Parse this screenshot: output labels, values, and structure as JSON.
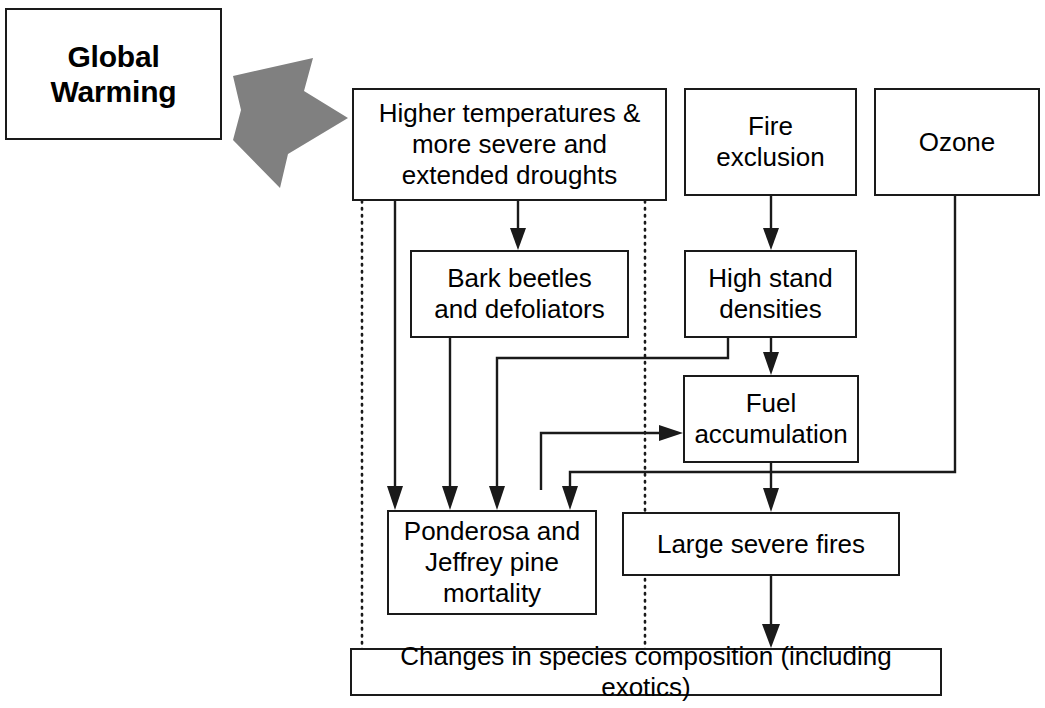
{
  "diagram": {
    "title_box": {
      "label": "Global\nWarming"
    },
    "big_arrow": {
      "icon": "thick-right-arrow"
    },
    "nodes": [
      {
        "id": "higher_temps",
        "label": "Higher temperatures &\nmore severe and\nextended droughts"
      },
      {
        "id": "fire_exclusion",
        "label": "Fire\nexclusion"
      },
      {
        "id": "ozone",
        "label": "Ozone"
      },
      {
        "id": "bark_beetles",
        "label": "Bark beetles\nand defoliators"
      },
      {
        "id": "high_stand",
        "label": "High stand\ndensities"
      },
      {
        "id": "fuel_accumulation",
        "label": "Fuel\naccumulation"
      },
      {
        "id": "ponderosa",
        "label": "Ponderosa and\nJeffrey pine\nmortality"
      },
      {
        "id": "large_fires",
        "label": "Large severe fires"
      },
      {
        "id": "species_change",
        "label": "Changes in species composition (including exotics)"
      }
    ],
    "edges": [
      {
        "from": "global_warming",
        "to": "higher_temps",
        "style": "block-arrow"
      },
      {
        "from": "higher_temps",
        "to": "bark_beetles",
        "style": "solid-arrow"
      },
      {
        "from": "higher_temps",
        "to": "ponderosa",
        "style": "solid-arrow"
      },
      {
        "from": "higher_temps",
        "to": "ponderosa",
        "style": "solid-arrow"
      },
      {
        "from": "higher_temps",
        "to": "species_change",
        "style": "dotted"
      },
      {
        "from": "higher_temps",
        "to": "species_change",
        "style": "dotted"
      },
      {
        "from": "bark_beetles",
        "to": "ponderosa",
        "style": "solid-arrow"
      },
      {
        "from": "bark_beetles",
        "to": "fuel_accumulation",
        "style": "solid-arrow"
      },
      {
        "from": "fire_exclusion",
        "to": "high_stand",
        "style": "solid-arrow"
      },
      {
        "from": "high_stand",
        "to": "fuel_accumulation",
        "style": "solid-arrow"
      },
      {
        "from": "high_stand",
        "to": "ponderosa",
        "style": "solid-arrow"
      },
      {
        "from": "fuel_accumulation",
        "to": "large_fires",
        "style": "solid-arrow"
      },
      {
        "from": "ozone",
        "to": "ponderosa",
        "style": "solid-arrow"
      },
      {
        "from": "large_fires",
        "to": "species_change",
        "style": "solid-arrow"
      }
    ],
    "colors": {
      "line": "#1a1a1a",
      "box_fill": "#ffffff",
      "block_arrow": "#808080",
      "background": "#ffffff"
    }
  }
}
